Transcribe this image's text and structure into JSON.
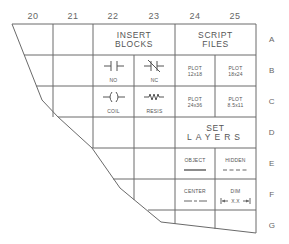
{
  "columns": [
    {
      "label": "20",
      "x": 13
    },
    {
      "label": "21",
      "x": 53
    },
    {
      "label": "22",
      "x": 93
    },
    {
      "label": "23",
      "x": 134
    },
    {
      "label": "24",
      "x": 175
    },
    {
      "label": "25",
      "x": 215
    }
  ],
  "rows": [
    {
      "label": "A",
      "y": 24
    },
    {
      "label": "B",
      "y": 55
    },
    {
      "label": "C",
      "y": 86
    },
    {
      "label": "D",
      "y": 117
    },
    {
      "label": "E",
      "y": 148
    },
    {
      "label": "F",
      "y": 179
    },
    {
      "label": "G",
      "y": 210
    }
  ],
  "headers": {
    "insert_blocks": [
      "INSERT",
      "BLOCKS"
    ],
    "script_files": [
      "SCRIPT",
      "FILES"
    ],
    "set_layers": [
      "SET",
      "LAYERS"
    ]
  },
  "blocks": {
    "no": "NO",
    "nc": "NC",
    "coil": "COIL",
    "resis": "RESIS"
  },
  "scripts": [
    {
      "line1": "PLOT",
      "line2": "12x18"
    },
    {
      "line1": "PLOT",
      "line2": "18x24"
    },
    {
      "line1": "PLOT",
      "line2": "24x36"
    },
    {
      "line1": "PLOT",
      "line2": "8.5x11"
    }
  ],
  "layers": {
    "object": "OBJECT",
    "hidden": "HIDDEN",
    "center": "CENTER",
    "dim": "DIM",
    "dim_value": "X.X"
  },
  "colors": {
    "line": "#6a6a6a",
    "text": "#555555"
  }
}
